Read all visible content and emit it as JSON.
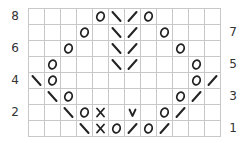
{
  "chart": {
    "title": "",
    "columns": 12,
    "rows": 8,
    "legend_symbols": {
      "O": "yarn-over",
      "\\": "left-leaning-decrease",
      "/": "right-leaning-decrease",
      "X": "cross-stitch",
      "V": "slip-stitch",
      "": "knit-blank"
    },
    "row_labels_left": [
      "8",
      "6",
      "4",
      "2"
    ],
    "row_labels_right": [
      "7",
      "5",
      "3",
      "1"
    ],
    "grid": [
      [
        "",
        "",
        "",
        "",
        "O",
        "\\",
        "/",
        "O",
        "",
        "",
        "",
        ""
      ],
      [
        "",
        "",
        "",
        "O",
        "",
        "\\",
        "/",
        "",
        "O",
        "",
        "",
        ""
      ],
      [
        "",
        "",
        "O",
        "",
        "",
        "\\",
        "/",
        "",
        "",
        "O",
        "",
        ""
      ],
      [
        "",
        "O",
        "",
        "",
        "",
        "\\",
        "/",
        "",
        "",
        "",
        "O",
        ""
      ],
      [
        "\\",
        "O",
        "",
        "",
        "",
        "",
        "",
        "",
        "",
        "",
        "O",
        "/"
      ],
      [
        "",
        "\\",
        "O",
        "",
        "",
        "",
        "",
        "",
        "",
        "O",
        "/",
        ""
      ],
      [
        "",
        "",
        "\\",
        "O",
        "X",
        "",
        "V",
        "",
        "O",
        "/",
        "",
        ""
      ],
      [
        "",
        "",
        "",
        "\\",
        "X",
        "O",
        "/",
        "O",
        "/",
        "",
        "",
        ""
      ]
    ]
  },
  "chart_data": {
    "type": "table",
    "xlabel": "",
    "ylabel": "Row",
    "columns": 12,
    "rows": 8,
    "row_numbers_top_to_bottom": [
      8,
      7,
      6,
      5,
      4,
      3,
      2,
      1
    ],
    "left_labels": [
      "8",
      "6",
      "4",
      "2"
    ],
    "right_labels": [
      "7",
      "5",
      "3",
      "1"
    ],
    "cells_top_to_bottom": [
      [
        "",
        "",
        "",
        "",
        "O",
        "\\",
        "/",
        "O",
        "",
        "",
        "",
        ""
      ],
      [
        "",
        "",
        "",
        "O",
        "",
        "\\",
        "/",
        "",
        "O",
        "",
        "",
        ""
      ],
      [
        "",
        "",
        "O",
        "",
        "",
        "\\",
        "/",
        "",
        "",
        "O",
        "",
        ""
      ],
      [
        "",
        "O",
        "",
        "",
        "",
        "\\",
        "/",
        "",
        "",
        "",
        "O",
        ""
      ],
      [
        "\\",
        "O",
        "",
        "",
        "",
        "",
        "",
        "",
        "",
        "",
        "O",
        "/"
      ],
      [
        "",
        "\\",
        "O",
        "",
        "",
        "",
        "",
        "",
        "",
        "O",
        "/",
        ""
      ],
      [
        "",
        "",
        "\\",
        "O",
        "X",
        "",
        "V",
        "",
        "O",
        "/",
        "",
        ""
      ],
      [
        "",
        "",
        "",
        "\\",
        "X",
        "O",
        "/",
        "O",
        "/",
        "",
        "",
        ""
      ]
    ],
    "grid": true
  }
}
